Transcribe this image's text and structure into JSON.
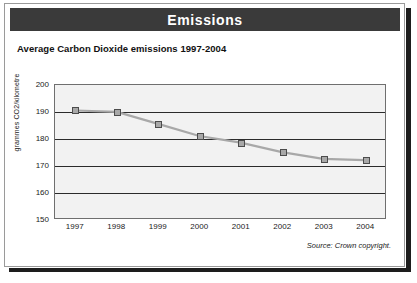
{
  "banner": {
    "title": "Emissions"
  },
  "chart_title": "Average Carbon Dioxide emissions 1997-2004",
  "source_note": "Source: Crown copyright.",
  "illustration": {
    "name": "cars-with-exhaust-smoke-illustration"
  },
  "chart_data": {
    "type": "line",
    "title": "Average Carbon Dioxide emissions 1997-2004",
    "xlabel": "",
    "ylabel": "grammes CO2/kilometre",
    "categories": [
      "1997",
      "1998",
      "1999",
      "2000",
      "2001",
      "2002",
      "2003",
      "2004"
    ],
    "values": [
      190.5,
      190,
      185.5,
      181,
      178.5,
      175,
      172.5,
      172
    ],
    "ylim": [
      150,
      200
    ],
    "yticks": [
      150,
      160,
      170,
      180,
      190,
      200
    ],
    "ytick_labels": [
      "150",
      "160",
      "170",
      "180",
      "190",
      "200"
    ],
    "grid": true,
    "legend": "none",
    "series_color": "#a8a8a8",
    "marker_color": "#a8a8a8",
    "marker_edge_color": "#4c4c4c"
  },
  "colors": {
    "banner_background": "#3a3a3a",
    "banner_text": "#ffffff",
    "plot_background": "#f2f2f2",
    "gridline": "#2b2b2b",
    "card_border": "#9a9a9a",
    "shadow": "#1d1d1d"
  }
}
